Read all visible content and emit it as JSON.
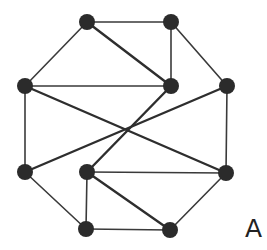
{
  "diagram": {
    "label": "A",
    "colors": {
      "node": "#2b2b2b",
      "edge": "#3a3a3a",
      "background": "#ffffff"
    },
    "node_radius": 8,
    "nodes": [
      {
        "id": "TL",
        "x": 87,
        "y": 22
      },
      {
        "id": "TR",
        "x": 171,
        "y": 22
      },
      {
        "id": "LU",
        "x": 25,
        "y": 86
      },
      {
        "id": "IU",
        "x": 171,
        "y": 86
      },
      {
        "id": "RU",
        "x": 227,
        "y": 86
      },
      {
        "id": "LL",
        "x": 25,
        "y": 172
      },
      {
        "id": "IL",
        "x": 87,
        "y": 172
      },
      {
        "id": "RL",
        "x": 226,
        "y": 173
      },
      {
        "id": "BL",
        "x": 86,
        "y": 229
      },
      {
        "id": "BR",
        "x": 170,
        "y": 230
      }
    ],
    "edges": [
      {
        "from": "TL",
        "to": "TR"
      },
      {
        "from": "TL",
        "to": "LU"
      },
      {
        "from": "TL",
        "to": "IU",
        "thick": true
      },
      {
        "from": "TR",
        "to": "IU"
      },
      {
        "from": "TR",
        "to": "RU"
      },
      {
        "from": "LU",
        "to": "IU"
      },
      {
        "from": "LU",
        "to": "RL",
        "thick": true
      },
      {
        "from": "LU",
        "to": "LL"
      },
      {
        "from": "RU",
        "to": "LL",
        "thick": true
      },
      {
        "from": "RU",
        "to": "RL"
      },
      {
        "from": "IU",
        "to": "IL",
        "thick": true
      },
      {
        "from": "LL",
        "to": "BL"
      },
      {
        "from": "IL",
        "to": "RL"
      },
      {
        "from": "IL",
        "to": "BL"
      },
      {
        "from": "IL",
        "to": "BR",
        "thick": true
      },
      {
        "from": "BL",
        "to": "BR"
      },
      {
        "from": "RL",
        "to": "BR"
      }
    ]
  }
}
